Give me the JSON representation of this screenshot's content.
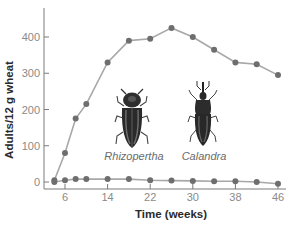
{
  "chart_data": {
    "type": "line",
    "title": "",
    "xlabel": "Time (weeks)",
    "ylabel": "Adults/12 g wheat",
    "x_ticks": [
      6,
      14,
      22,
      30,
      38,
      46
    ],
    "y_ticks": [
      0,
      100,
      200,
      300,
      400
    ],
    "xlim": [
      2,
      48
    ],
    "ylim": [
      -10,
      470
    ],
    "grid": false,
    "legend": "none (species labelled by inline beetle illustrations)",
    "x": [
      4,
      6,
      8,
      10,
      14,
      18,
      22,
      26,
      30,
      34,
      38,
      42,
      46
    ],
    "series": [
      {
        "name": "Rhizopertha",
        "values": [
          5,
          80,
          175,
          215,
          330,
          390,
          395,
          425,
          400,
          365,
          330,
          325,
          295
        ]
      },
      {
        "name": "Calandra",
        "values": [
          0,
          5,
          8,
          8,
          8,
          8,
          5,
          4,
          3,
          2,
          2,
          0,
          -5
        ]
      }
    ],
    "annotations": [
      "Rhizopertha",
      "Calandra"
    ]
  },
  "labels": {
    "xlabel": "Time (weeks)",
    "ylabel": "Adults/12 g wheat",
    "species_1": "Rhizopertha",
    "species_2": "Calandra"
  },
  "style": {
    "line_color": "#a8a8a8",
    "marker_color": "#6e6e6e",
    "axis_color": "#7a7a7a"
  }
}
